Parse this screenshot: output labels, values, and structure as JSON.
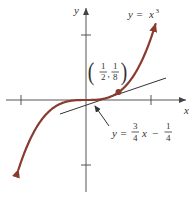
{
  "figure": {
    "axes": {
      "x_label": "x",
      "y_label": "y",
      "origin_px": [
        86,
        100
      ],
      "scale_px_per_unit": 65,
      "ticks": {
        "x": [
          -1,
          1
        ],
        "y": [
          -1,
          1
        ]
      },
      "axis_color": "#444444"
    },
    "curve": {
      "equation_label_lhs": "y =",
      "equation_label_base": "x",
      "equation_label_exp": "3",
      "function": "x^3",
      "color": "#8b3a2f",
      "arrows": "both ends"
    },
    "tangent_line": {
      "label_lhs": "y =",
      "frac1_num": "3",
      "frac1_den": "4",
      "var": "x",
      "minus": "−",
      "frac2_num": "1",
      "frac2_den": "4",
      "slope": 0.75,
      "intercept": -0.25,
      "color": "#333333"
    },
    "point": {
      "label_frac1_num": "1",
      "label_frac1_den": "2",
      "label_comma": ",",
      "label_frac2_num": "1",
      "label_frac2_den": "8",
      "x": 0.5,
      "y": 0.125,
      "color": "#8b3a2f"
    }
  },
  "chart_data": {
    "type": "line",
    "title": "",
    "xlabel": "x",
    "ylabel": "y",
    "series": [
      {
        "name": "y = x^3",
        "function": "x^3",
        "x": [
          -1.05,
          -1,
          -0.75,
          -0.5,
          -0.25,
          0,
          0.25,
          0.5,
          0.75,
          1,
          1.05
        ],
        "values": [
          -1.158,
          -1,
          -0.422,
          -0.125,
          -0.016,
          0,
          0.016,
          0.125,
          0.422,
          1,
          1.158
        ]
      },
      {
        "name": "y = 3/4 x - 1/4",
        "function": "0.75x - 0.25",
        "x": [
          -0.4,
          1.2
        ],
        "values": [
          -0.55,
          0.65
        ]
      }
    ],
    "annotations": [
      {
        "text": "(1/2, 1/8)",
        "x": 0.5,
        "y": 0.125,
        "type": "point of tangency"
      },
      {
        "text": "y = x^3",
        "type": "curve label"
      },
      {
        "text": "y = 3/4 x - 1/4",
        "type": "tangent line label with arrow"
      }
    ],
    "xlim": [
      -1.3,
      1.6
    ],
    "ylim": [
      -1.5,
      1.5
    ],
    "x_ticks": [
      -1,
      1
    ],
    "y_ticks": [
      -1,
      1
    ],
    "grid": false
  }
}
